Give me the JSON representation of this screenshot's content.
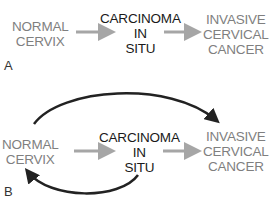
{
  "panel_a": {
    "label": "A",
    "nodes": {
      "normal": [
        "NORMAL",
        "CERVIX"
      ],
      "cis": [
        "CARCINOMA",
        "IN",
        "SITU"
      ],
      "invasive": [
        "INVASIVE",
        "CERVICAL",
        "CANCER"
      ]
    },
    "arrows": [
      "normal -> cis",
      "cis -> invasive"
    ]
  },
  "panel_b": {
    "label": "B",
    "nodes": {
      "normal": [
        "NORMAL",
        "CERVIX"
      ],
      "cis": [
        "CARCINOMA",
        "IN",
        "SITU"
      ],
      "invasive": [
        "INVASIVE",
        "CERVICAL",
        "CANCER"
      ]
    },
    "arrows": [
      "normal -> cis",
      "cis -> invasive",
      "normal -> invasive (curved, over top)",
      "cis -> normal (curved, regression)"
    ]
  },
  "colors": {
    "gray_text": "#7f7f7f",
    "black_text": "#1a1a1a",
    "gray_arrow": "#a6a6a6",
    "black_arrow": "#222222"
  }
}
